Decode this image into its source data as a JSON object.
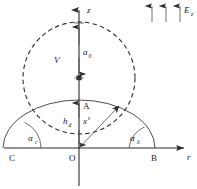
{
  "figure": {
    "background_color": "#ffffff",
    "width": 197,
    "height": 189,
    "line_color": "#2b2b2b",
    "curve_color": "#3a3a3a",
    "text_color": "#1a1a1a"
  },
  "axes": {
    "vertical": {
      "name": "z-axis",
      "label": "z",
      "italic": true,
      "x": 79,
      "y_top": 8,
      "y_bottom": 186,
      "arrow": "up"
    },
    "horizontal": {
      "name": "r-axis",
      "label": "r",
      "italic": true,
      "y": 148,
      "x_left": 4,
      "x_right": 186,
      "arrow": "right"
    }
  },
  "points": [
    {
      "name": "origin",
      "label": "O",
      "x": 79,
      "y": 148,
      "label_dx": -8,
      "label_dy": 12
    },
    {
      "name": "point-c",
      "label": "C",
      "x": 13,
      "y": 148,
      "label_dx": -3,
      "label_dy": 12
    },
    {
      "name": "point-b",
      "label": "B",
      "x": 155,
      "y": 148,
      "label_dx": -3,
      "label_dy": 12
    },
    {
      "name": "point-a",
      "label": "A",
      "x": 79,
      "y": 100,
      "label_dx": 4,
      "label_dy": 8
    }
  ],
  "labels": {
    "field": {
      "symbol": "E",
      "subscript": "z",
      "x": 186,
      "y": 10
    },
    "potential": {
      "symbol": "V",
      "x": 57,
      "y": 60
    },
    "sphere_radius": {
      "symbol": "a",
      "subscript": "0",
      "x": 85,
      "y": 52
    },
    "height": {
      "symbol": "h",
      "subscript": "d",
      "x": 68,
      "y": 120
    },
    "radial_coord": {
      "symbol": "x",
      "superscript": "s",
      "x": 86,
      "y": 120
    },
    "angle_left": {
      "symbol": "α",
      "subscript": "c",
      "x": 32,
      "y": 138
    },
    "angle_right": {
      "symbol": "α",
      "subscript": "b",
      "x": 133,
      "y": 138
    }
  },
  "shapes": {
    "dashed_circle": {
      "name": "dashed-sphere-outline",
      "center_x": 79,
      "center_y": 78,
      "radius": 56,
      "style": "dashed"
    },
    "solid_drop_arc": {
      "name": "drop-profile-arc",
      "center_x": 79,
      "center_y": 148,
      "radius_x": 76,
      "radius_y": 48,
      "style": "solid"
    },
    "radius_vector": {
      "name": "radius-vector-arrow",
      "from_x": 79,
      "from_y": 148,
      "to_x": 120,
      "to_y": 105
    },
    "angle_arc_left": {
      "name": "angle-arc-left",
      "vertex_x": 13,
      "vertex_y": 148,
      "radius": 28
    },
    "angle_arc_right": {
      "name": "angle-arc-right",
      "vertex_x": 155,
      "vertex_y": 148,
      "radius": 26
    },
    "field_arrows": {
      "name": "uniform-field-arrows",
      "count": 3,
      "x_positions": [
        152,
        166,
        180
      ],
      "y_tail": 22,
      "y_head": 4,
      "direction": "up"
    },
    "dimension_ticks": {
      "name": "dimension-tick-marks",
      "x": 79,
      "y_values": [
        23,
        78,
        100
      ]
    }
  }
}
